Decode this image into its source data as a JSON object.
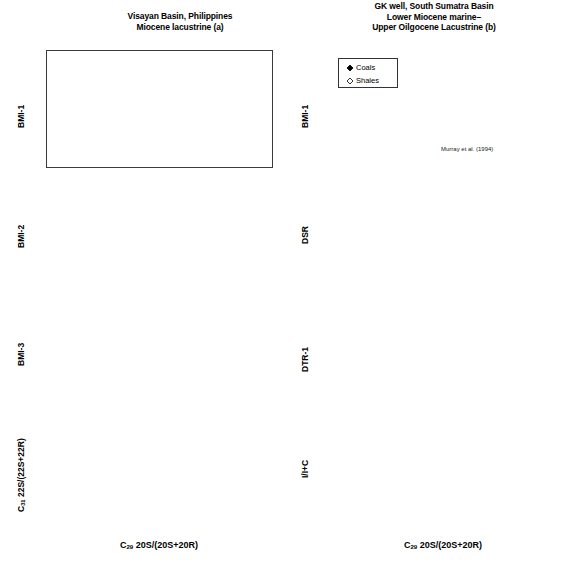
{
  "figure": {
    "width": 568,
    "height": 563,
    "background": "#ffffff",
    "foreground": "#000000"
  },
  "columns": {
    "left": {
      "title_lines": [
        "Visayan Basin, Philippines",
        "Miocene lacustrine (a)"
      ],
      "xlabel_prefix": "C",
      "xlabel_sub": "29",
      "xlabel_rest": " 20S/(20S+20R)"
    },
    "right": {
      "title_lines": [
        "GK well, South Sumatra Basin",
        "Lower Miocene marine–",
        "Upper Oilgocene Lacustrine (b)"
      ],
      "xlabel_prefix": "C",
      "xlabel_sub": "29",
      "xlabel_rest": " 20S/(20S+20R)"
    }
  },
  "legend": {
    "position": "inside-top-left-of-panel-b1",
    "entries": [
      {
        "label": "Coals",
        "marker": "filled-diamond",
        "color": "#000000"
      },
      {
        "label": "Shales",
        "marker": "open-diamond",
        "color": "#ffffff"
      }
    ]
  },
  "annotations": [
    {
      "panel": "b1",
      "text": "Murray et al. (1994)",
      "x_data": 0.4,
      "y_data": 0.55,
      "arrow_to": {
        "x_data": 0.197,
        "y_data": 1.87
      }
    }
  ],
  "chart_data": [
    {
      "id": "a1",
      "type": "scatter",
      "title": "Visayan Basin, Philippines / Miocene lacustrine (a)",
      "xlabel": "C29 20S/(20S+20R)",
      "ylabel": "BMI-1",
      "xlim": [
        0.0,
        0.6
      ],
      "ylim": [
        0,
        5
      ],
      "xticks": [
        0.0,
        0.1,
        0.2,
        0.3,
        0.4,
        0.5,
        0.6
      ],
      "yticks": [
        0,
        1,
        2,
        3,
        4,
        5
      ],
      "xticklabels": [
        "0.0",
        "0.1",
        "0.2",
        "0.3",
        "0.4",
        "0.5",
        "0.6"
      ],
      "yticklabels": [
        "0",
        "1",
        "2",
        "3",
        "4",
        "5"
      ],
      "grid": false,
      "legend": false,
      "series": [
        {
          "name": "Coals",
          "marker": "filled-diamond",
          "points": [
            [
              0.063,
              0.8
            ],
            [
              0.082,
              1.0
            ],
            [
              0.125,
              0.72
            ],
            [
              0.126,
              0.83
            ],
            [
              0.128,
              1.17
            ],
            [
              0.197,
              2.1
            ],
            [
              0.198,
              1.8
            ],
            [
              0.207,
              1.4
            ],
            [
              0.225,
              1.98
            ],
            [
              0.298,
              2.88
            ],
            [
              0.3,
              2.26
            ],
            [
              0.4,
              2.6
            ],
            [
              0.418,
              2.52
            ],
            [
              0.44,
              2.62
            ],
            [
              0.565,
              3.0
            ]
          ]
        }
      ],
      "errorbars": [
        {
          "x": 0.565,
          "y": 3.0,
          "xerr": 0.022,
          "yerr": 0.33
        }
      ],
      "fit_curve": {
        "style": "sigmoid-plateau",
        "points": [
          [
            0.035,
            0.23
          ],
          [
            0.1,
            0.9
          ],
          [
            0.16,
            1.45
          ],
          [
            0.22,
            2.0
          ],
          [
            0.28,
            2.45
          ],
          [
            0.33,
            2.7
          ],
          [
            0.4,
            2.75
          ],
          [
            0.5,
            2.74
          ],
          [
            0.6,
            2.73
          ]
        ]
      }
    },
    {
      "id": "a2",
      "type": "scatter",
      "ylabel": "BMI-2",
      "xlim": [
        0.0,
        0.6
      ],
      "ylim": [
        0,
        10
      ],
      "xticks": [
        0.0,
        0.1,
        0.2,
        0.3,
        0.4,
        0.5,
        0.6
      ],
      "yticks": [
        0,
        2,
        4,
        6,
        8,
        10
      ],
      "yticklabels": [
        "0",
        "2",
        "4",
        "6",
        "8",
        "10"
      ],
      "grid": false,
      "legend": false,
      "series": [
        {
          "name": "Coals",
          "marker": "filled-diamond",
          "points": [
            [
              0.063,
              1.8
            ],
            [
              0.082,
              1.78
            ],
            [
              0.123,
              2.95
            ],
            [
              0.128,
              3.05
            ],
            [
              0.197,
              4.92
            ],
            [
              0.198,
              3.4
            ],
            [
              0.2,
              3.25
            ],
            [
              0.224,
              5.02
            ],
            [
              0.3,
              5.45
            ],
            [
              0.31,
              4.18
            ],
            [
              0.4,
              8.0
            ],
            [
              0.418,
              6.55
            ],
            [
              0.455,
              9.18
            ],
            [
              0.56,
              8.7
            ]
          ]
        }
      ],
      "errorbars": [
        {
          "x": 0.56,
          "y": 8.7,
          "xerr": 0.022,
          "yerr": 1.3
        }
      ]
    },
    {
      "id": "a3",
      "type": "scatter",
      "ylabel": "BMI-3",
      "xlim": [
        0.0,
        0.6
      ],
      "ylim": [
        0,
        0.3
      ],
      "xticks": [
        0.0,
        0.1,
        0.2,
        0.3,
        0.4,
        0.5,
        0.6
      ],
      "yticks": [
        0,
        0.1,
        0.2,
        0.3
      ],
      "yticklabels": [
        "0",
        "0.1",
        "0.2",
        "0.3"
      ],
      "grid": false,
      "legend": false,
      "series": [
        {
          "name": "Coals",
          "marker": "filled-diamond",
          "points": [
            [
              0.063,
              0.05
            ],
            [
              0.082,
              0.012
            ],
            [
              0.123,
              0.025
            ],
            [
              0.128,
              0.08
            ],
            [
              0.128,
              0.29
            ],
            [
              0.197,
              0.17
            ],
            [
              0.198,
              0.152
            ],
            [
              0.203,
              0.156
            ],
            [
              0.222,
              0.14
            ],
            [
              0.3,
              0.143
            ],
            [
              0.313,
              0.134
            ],
            [
              0.4,
              0.19
            ],
            [
              0.418,
              0.15
            ],
            [
              0.44,
              0.208
            ],
            [
              0.555,
              0.225
            ]
          ]
        }
      ],
      "errorbars": [
        {
          "x": 0.555,
          "y": 0.225,
          "xerr": 0.022,
          "yerr": 0.04
        }
      ]
    },
    {
      "id": "a4",
      "type": "scatter",
      "ylabel": "C31 22S/(22S+22R)",
      "ylabel_prefix": "C",
      "ylabel_sub": "31",
      "ylabel_rest": " 22S/(22S+22R)",
      "xlabel": "C29 20S/(20S+20R)",
      "xlim": [
        0.0,
        0.6
      ],
      "ylim": [
        0,
        0.7
      ],
      "xticks": [
        0.0,
        0.1,
        0.2,
        0.3,
        0.4,
        0.5,
        0.6
      ],
      "yticks": [
        0,
        0.2,
        0.4,
        0.6
      ],
      "yticklabels": [
        "0.0",
        "0.2",
        "0.4",
        "0.6"
      ],
      "xticklabels": [
        "0.0",
        "0.1",
        "0.2",
        "0.3",
        "0.4",
        "0.5",
        "0.6"
      ],
      "grid": false,
      "legend": false,
      "series": [
        {
          "name": "Coals",
          "marker": "filled-diamond",
          "points": [
            [
              0.063,
              0.255
            ],
            [
              0.082,
              0.333
            ],
            [
              0.122,
              0.52
            ],
            [
              0.125,
              0.508
            ],
            [
              0.128,
              0.492
            ],
            [
              0.197,
              0.557
            ],
            [
              0.198,
              0.52
            ],
            [
              0.222,
              0.548
            ],
            [
              0.3,
              0.552
            ],
            [
              0.313,
              0.55
            ],
            [
              0.4,
              0.522
            ],
            [
              0.418,
              0.522
            ],
            [
              0.44,
              0.568
            ],
            [
              0.555,
              0.562
            ]
          ]
        }
      ],
      "errorbars": [
        {
          "x": 0.555,
          "y": 0.562,
          "xerr": 0.022,
          "yerr": 0.055
        }
      ]
    },
    {
      "id": "b1",
      "type": "scatter",
      "title": "GK well, South Sumatra Basin / Lower Miocene marine–Upper Oilgocene Lacustrine (b)",
      "ylabel": "BMI-1",
      "xlim": [
        0.0,
        0.6
      ],
      "ylim": [
        0,
        5
      ],
      "xticks": [
        0.0,
        0.1,
        0.2,
        0.3,
        0.4,
        0.5,
        0.6
      ],
      "yticks": [
        0,
        1,
        2,
        3,
        4,
        5
      ],
      "yticklabels": [
        "0",
        "1",
        "2",
        "3",
        "4",
        "5"
      ],
      "grid": false,
      "legend": true,
      "series": [
        {
          "name": "Shales",
          "marker": "open-diamond",
          "points": [
            [
              0.075,
              1.4
            ],
            [
              0.105,
              1.5
            ],
            [
              0.178,
              1.93
            ],
            [
              0.185,
              2.08
            ],
            [
              0.275,
              2.8
            ],
            [
              0.38,
              2.98
            ],
            [
              0.42,
              2.77
            ]
          ]
        },
        {
          "name": "Coals",
          "marker": "filled-diamond",
          "points": [
            [
              0.197,
              1.87
            ],
            [
              0.48,
              2.78
            ],
            [
              0.483,
              2.36
            ],
            [
              0.515,
              3.85
            ],
            [
              0.52,
              3.1
            ],
            [
              0.548,
              3.95
            ],
            [
              0.553,
              3.08
            ]
          ]
        }
      ],
      "fit_curve": {
        "style": "sigmoid-plateau",
        "points": [
          [
            0.032,
            0.25
          ],
          [
            0.1,
            1.05
          ],
          [
            0.16,
            1.62
          ],
          [
            0.22,
            2.15
          ],
          [
            0.27,
            2.55
          ],
          [
            0.31,
            2.73
          ],
          [
            0.38,
            2.76
          ],
          [
            0.48,
            2.76
          ],
          [
            0.6,
            2.76
          ]
        ]
      }
    },
    {
      "id": "b2",
      "type": "scatter",
      "ylabel": "DSR",
      "xlim": [
        0.0,
        0.6
      ],
      "ylim": [
        0,
        1
      ],
      "xticks": [
        0.0,
        0.1,
        0.2,
        0.3,
        0.4,
        0.5,
        0.6
      ],
      "yticks": [
        0,
        0.2,
        0.4,
        0.6,
        0.8,
        1
      ],
      "yticklabels": [
        "0",
        "0.2",
        "0.4",
        "0.6",
        "0.8",
        "1"
      ],
      "grid": false,
      "legend": false,
      "series": [
        {
          "name": "Shales",
          "marker": "open-diamond",
          "points": [
            [
              0.075,
              0.39
            ],
            [
              0.172,
              0.62
            ],
            [
              0.178,
              0.445
            ],
            [
              0.275,
              0.875
            ],
            [
              0.357,
              0.54
            ],
            [
              0.38,
              0.905
            ]
          ]
        },
        {
          "name": "Coals",
          "marker": "filled-diamond",
          "points": [
            [
              0.455,
              0.885
            ],
            [
              0.47,
              0.705
            ],
            [
              0.487,
              0.82
            ],
            [
              0.5,
              0.99
            ],
            [
              0.545,
              0.915
            ]
          ]
        }
      ]
    },
    {
      "id": "b3",
      "type": "scatter",
      "ylabel": "DTR-1",
      "xlim": [
        0.0,
        0.6
      ],
      "ylim": [
        0,
        1
      ],
      "xticks": [
        0.0,
        0.1,
        0.2,
        0.3,
        0.4,
        0.5,
        0.6
      ],
      "yticks": [
        0,
        0.2,
        0.4,
        0.6,
        0.8,
        1
      ],
      "yticklabels": [
        "0",
        "0.2",
        "0.4",
        "0.6",
        "0.8",
        "1"
      ],
      "grid": false,
      "legend": false,
      "series": [
        {
          "name": "Shales",
          "marker": "open-diamond",
          "points": [
            [
              0.078,
              0.0
            ],
            [
              0.148,
              0.0
            ],
            [
              0.272,
              0.7
            ],
            [
              0.345,
              0.125
            ],
            [
              0.372,
              0.525
            ]
          ]
        },
        {
          "name": "Coals",
          "marker": "filled-diamond",
          "points": [
            [
              0.45,
              0.385
            ],
            [
              0.458,
              0.285
            ],
            [
              0.478,
              0.4
            ],
            [
              0.517,
              0.805
            ],
            [
              0.54,
              0.705
            ],
            [
              0.543,
              0.545
            ]
          ]
        }
      ]
    },
    {
      "id": "b4",
      "type": "scatter",
      "ylabel": "I/I+C",
      "xlabel": "C29 20S/(20S+20R)",
      "xlim": [
        0.0,
        0.6
      ],
      "ylim": [
        0,
        0.3
      ],
      "xticks": [
        0.0,
        0.1,
        0.2,
        0.3,
        0.4,
        0.5,
        0.6
      ],
      "yticks": [
        0,
        0.1,
        0.2,
        0.3
      ],
      "yticklabels": [
        "0",
        "0.1",
        "0.2",
        "0.3"
      ],
      "xticklabels": [
        "0",
        "0.1",
        "0.2",
        "0.3",
        "0.4",
        "0.5",
        "0.6"
      ],
      "grid": false,
      "legend": false,
      "series": [
        {
          "name": "Shales",
          "marker": "open-diamond",
          "points": [
            [
              0.072,
              0.05
            ],
            [
              0.098,
              0.06
            ],
            [
              0.17,
              0.1
            ],
            [
              0.175,
              0.055
            ],
            [
              0.252,
              0.148
            ],
            [
              0.345,
              0.073
            ],
            [
              0.372,
              0.178
            ]
          ]
        },
        {
          "name": "Coals",
          "marker": "filled-diamond",
          "points": [
            [
              0.448,
              0.105
            ],
            [
              0.455,
              0.1
            ],
            [
              0.462,
              0.098
            ],
            [
              0.48,
              0.107
            ],
            [
              0.505,
              0.247
            ],
            [
              0.528,
              0.175
            ],
            [
              0.532,
              0.173
            ]
          ]
        }
      ]
    }
  ]
}
